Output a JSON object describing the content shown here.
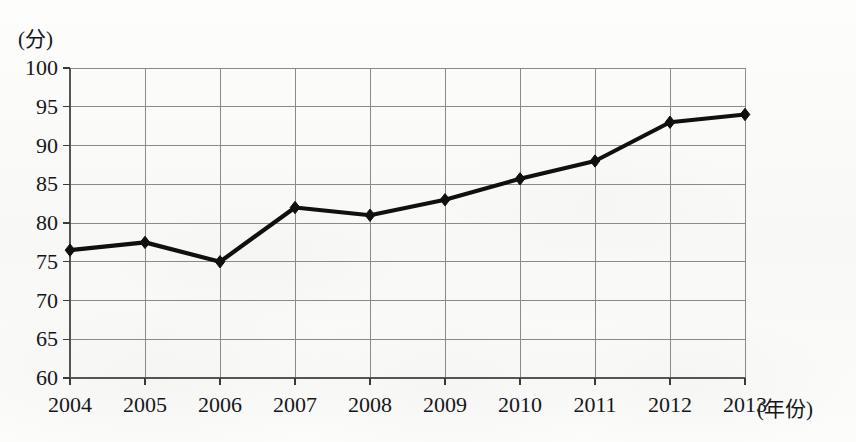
{
  "chart_data": {
    "type": "line",
    "title": "",
    "subtitle": "",
    "xlabel": "(年份)",
    "ylabel": "(分)",
    "categories": [
      "2004",
      "2005",
      "2006",
      "2007",
      "2008",
      "2009",
      "2010",
      "2011",
      "2012",
      "2013"
    ],
    "x": [
      2004,
      2005,
      2006,
      2007,
      2008,
      2009,
      2010,
      2011,
      2012,
      2013
    ],
    "values": [
      76.5,
      77.5,
      75,
      82,
      81,
      83,
      85.7,
      88,
      93,
      94
    ],
    "series": [
      {
        "name": "",
        "values": [
          76.5,
          77.5,
          75,
          82,
          81,
          83,
          85.7,
          88,
          93,
          94
        ]
      }
    ],
    "ylim": [
      60,
      100
    ],
    "ytick_step": 5,
    "yticks": [
      60,
      65,
      70,
      75,
      80,
      85,
      90,
      95,
      100
    ],
    "ytick_labels": [
      "60",
      "65",
      "70",
      "75",
      "80",
      "85",
      "90",
      "95",
      "100"
    ],
    "grid": true,
    "legend": "none",
    "marker": "diamond",
    "line_color": "#101010",
    "grid_color": "#8a8a8a",
    "axis_color": "#4a4a4a"
  }
}
